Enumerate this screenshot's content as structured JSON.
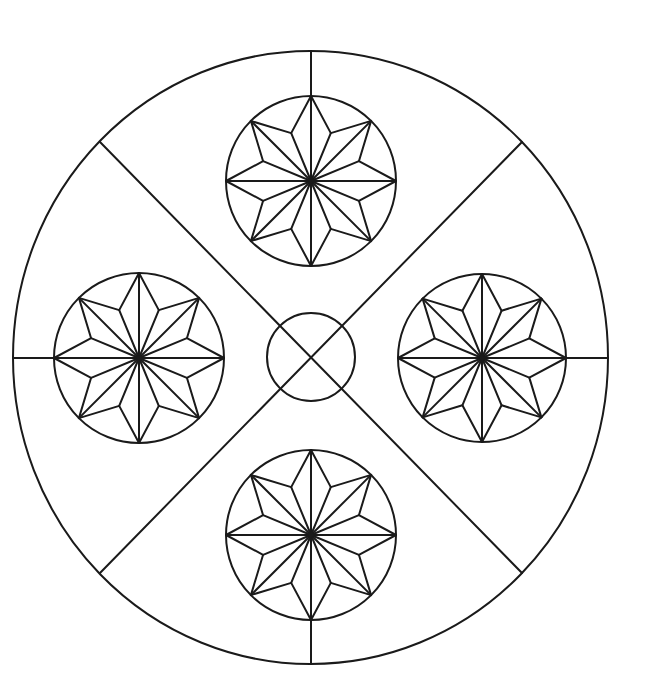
{
  "canvas": {
    "width": 647,
    "height": 698,
    "background": "#ffffff",
    "line_color": "#1a1a1a",
    "line_width": 2
  },
  "mandala": {
    "outer_circle": {
      "cx": 310.5,
      "cy": 357.5,
      "rx": 297.5,
      "ry": 306.5
    },
    "center_circle": {
      "cx": 311,
      "cy": 357,
      "r": 44
    },
    "diagonals": [
      {
        "x1": 100,
        "y1": 142,
        "x2": 522,
        "y2": 573
      },
      {
        "x1": 522,
        "y1": 142,
        "x2": 100,
        "y2": 573
      }
    ],
    "axis_segments": [
      {
        "name": "top",
        "x1": 311,
        "y1": 51,
        "x2": 311,
        "y2": 95
      },
      {
        "name": "bottom",
        "x1": 311,
        "y1": 621,
        "x2": 311,
        "y2": 664
      },
      {
        "name": "left",
        "x1": 13,
        "y1": 358,
        "x2": 55,
        "y2": 358
      },
      {
        "name": "right",
        "x1": 565,
        "y1": 358,
        "x2": 608,
        "y2": 358
      }
    ],
    "stars": [
      {
        "name": "top",
        "cx": 311,
        "cy": 181,
        "r": 85,
        "points": 8,
        "inner_ratio": 0.61
      },
      {
        "name": "left",
        "cx": 139,
        "cy": 358,
        "r": 85,
        "points": 8,
        "inner_ratio": 0.61
      },
      {
        "name": "right",
        "cx": 482,
        "cy": 358,
        "r": 84,
        "points": 8,
        "inner_ratio": 0.61
      },
      {
        "name": "bottom",
        "cx": 311,
        "cy": 535,
        "r": 85,
        "points": 8,
        "inner_ratio": 0.61
      }
    ]
  }
}
